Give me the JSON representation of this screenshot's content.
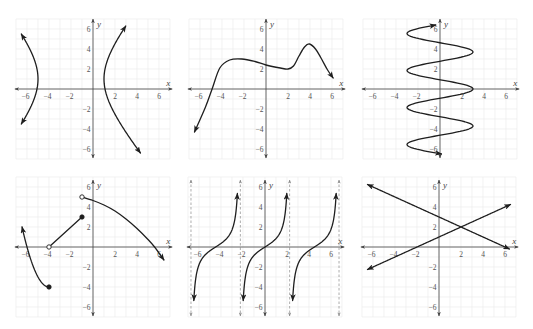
{
  "chart_data": [
    {
      "type": "line",
      "title": "",
      "xlabel": "x",
      "ylabel": "y",
      "xlim": [
        -7.1,
        7.2
      ],
      "ylim": [
        -6.9,
        7.0
      ],
      "grid": true,
      "grid_range": [
        -7,
        7
      ],
      "x_ticks": [
        -6,
        -4,
        -2,
        2,
        4,
        6
      ],
      "x_tick_labels": [
        "−6",
        "−4",
        "−2",
        "2",
        "4",
        "6"
      ],
      "y_ticks": [
        -6,
        -4,
        -2,
        2,
        4,
        6
      ],
      "y_tick_labels": [
        "−6",
        "−4",
        "−2",
        "2",
        "4",
        "6"
      ],
      "asymptotes_x": [],
      "series": [
        {
          "name": "hyperbola left branch",
          "kind": "x_of_y",
          "expr": "-2 - 3*Math.sqrt(1 + ((y-1)/4)**2)",
          "domain": [
            -3.5,
            5.5
          ],
          "start": "arrow",
          "end": "arrow"
        },
        {
          "name": "hyperbola right branch",
          "kind": "x_of_y",
          "expr": "-2 + 3*Math.sqrt(1 + ((y-1)/4)**2)",
          "domain": [
            -6.4,
            6.3
          ],
          "start": "arrow",
          "end": "arrow"
        }
      ],
      "key_points": {
        "vertices": [
          [
            -5,
            1
          ],
          [
            1,
            1
          ]
        ]
      }
    },
    {
      "type": "line",
      "title": "",
      "xlabel": "x",
      "ylabel": "y",
      "xlim": [
        -7.1,
        7.2
      ],
      "ylim": [
        -6.9,
        7.0
      ],
      "grid": true,
      "grid_range": [
        -7,
        7
      ],
      "x_ticks": [
        -6,
        -4,
        -2,
        2,
        4,
        6
      ],
      "x_tick_labels": [
        "−6",
        "−4",
        "−2",
        "2",
        "4",
        "6"
      ],
      "y_ticks": [
        -6,
        -4,
        -2,
        2,
        4,
        6
      ],
      "y_tick_labels": [
        "−6",
        "−4",
        "−2",
        "2",
        "4",
        "6"
      ],
      "asymptotes_x": [],
      "series": [
        {
          "name": "curve",
          "kind": "spline",
          "points": [
            [
              -6.5,
              -4.3
            ],
            [
              -5.5,
              -1.8
            ],
            [
              -4.9,
              0
            ],
            [
              -4.2,
              2.1
            ],
            [
              -3.3,
              2.9
            ],
            [
              -2.2,
              3.0
            ],
            [
              -1,
              2.75
            ],
            [
              0,
              2.4
            ],
            [
              1.3,
              2.1
            ],
            [
              2,
              2.0
            ],
            [
              2.5,
              2.3
            ],
            [
              3,
              3.3
            ],
            [
              3.5,
              4.2
            ],
            [
              3.95,
              4.5
            ],
            [
              4.5,
              4.0
            ],
            [
              5,
              3.1
            ],
            [
              5.6,
              1.9
            ],
            [
              6.1,
              1.1
            ]
          ],
          "start": "arrow",
          "end": "arrow"
        }
      ],
      "key_points": {
        "local_max": [
          [
            -2.2,
            3.0
          ],
          [
            4,
            4.5
          ]
        ],
        "local_min": [
          [
            2,
            2
          ]
        ],
        "x_intercept": [
          -4.9,
          0
        ]
      }
    },
    {
      "type": "line",
      "title": "",
      "xlabel": "x",
      "ylabel": "y",
      "xlim": [
        -7.1,
        7.2
      ],
      "ylim": [
        -6.9,
        7.0
      ],
      "grid": true,
      "grid_range": [
        -7,
        7
      ],
      "x_ticks": [
        -6,
        -4,
        -2,
        2,
        4,
        6
      ],
      "x_tick_labels": [
        "−6",
        "−4",
        "−2",
        "2",
        "4",
        "6"
      ],
      "y_ticks": [
        -6,
        -4,
        -2,
        2,
        4,
        6
      ],
      "y_tick_labels": [
        "−6",
        "−4",
        "−2",
        "2",
        "4",
        "6"
      ],
      "asymptotes_x": [],
      "series": [
        {
          "name": "sinusoid in y",
          "kind": "x_of_y",
          "expr": "3*Math.cos(2*Math.PI*y/3.7)",
          "domain": [
            -6.5,
            6.4
          ],
          "start": "arrow",
          "end": "arrow"
        }
      ],
      "key_points": {
        "rightmost": [
          [
            3,
            0
          ],
          [
            3,
            3.7
          ],
          [
            3,
            -3.7
          ]
        ],
        "leftmost": [
          [
            -3,
            1.85
          ],
          [
            -3,
            -1.85
          ],
          [
            -3,
            5.55
          ],
          [
            -3,
            -5.55
          ]
        ]
      }
    },
    {
      "type": "line",
      "title": "",
      "xlabel": "x",
      "ylabel": "y",
      "xlim": [
        -7.1,
        7.2
      ],
      "ylim": [
        -6.9,
        6.7
      ],
      "grid": true,
      "grid_range": [
        -7,
        7
      ],
      "x_ticks": [
        -6,
        -4,
        -2,
        2,
        4,
        6
      ],
      "x_tick_labels": [
        "−6",
        "−4",
        "−2",
        "2",
        "4",
        "6"
      ],
      "y_ticks": [
        -6,
        -4,
        -2,
        2,
        4,
        6
      ],
      "y_tick_labels": [
        "−6",
        "−4",
        "−2",
        "2",
        "4",
        "6"
      ],
      "asymptotes_x": [],
      "series": [
        {
          "name": "piece 1",
          "kind": "y_of_x",
          "expr": "(x+4)**2 - 4",
          "domain": [
            -6.45,
            -4
          ],
          "start": "arrow",
          "end": "filled"
        },
        {
          "name": "piece 2",
          "kind": "segment",
          "points": [
            [
              -4,
              0
            ],
            [
              -1,
              3
            ]
          ],
          "start": "open",
          "end": "filled"
        },
        {
          "name": "piece 3",
          "kind": "spline",
          "points": [
            [
              -1,
              5
            ],
            [
              0,
              4.65
            ],
            [
              1,
              4.2
            ],
            [
              2,
              3.6
            ],
            [
              3,
              2.8
            ],
            [
              4,
              1.85
            ],
            [
              5,
              0.75
            ],
            [
              5.6,
              0
            ],
            [
              6.45,
              -1.3
            ]
          ],
          "start": "open",
          "end": "arrow"
        }
      ],
      "key_points": {
        "filled": [
          [
            -4,
            -4
          ],
          [
            -1,
            3
          ]
        ],
        "open": [
          [
            -4,
            0
          ],
          [
            -1,
            5
          ]
        ]
      }
    },
    {
      "type": "line",
      "title": "",
      "xlabel": "x",
      "ylabel": "y",
      "xlim": [
        -7.1,
        7.2
      ],
      "ylim": [
        -6.9,
        6.7
      ],
      "grid": true,
      "grid_range": [
        -7,
        7
      ],
      "x_ticks": [
        -6,
        -4,
        -2,
        2,
        4,
        6
      ],
      "x_tick_labels": [
        "−6",
        "−4",
        "−2",
        "2",
        "4",
        "6"
      ],
      "y_ticks": [
        -6,
        -4,
        -2,
        2,
        4,
        6
      ],
      "y_tick_labels": [
        "−6",
        "−4",
        "−2",
        "2",
        "4",
        "6"
      ],
      "asymptotes_x": [
        -6.73,
        -2.24,
        2.24,
        6.73
      ],
      "series": [
        {
          "name": "branch left",
          "kind": "y_of_x",
          "expr": "Math.tan(0.7*(x+4.49))",
          "domain": [
            -6.47,
            -2.51
          ],
          "start": "arrow",
          "end": "arrow"
        },
        {
          "name": "branch center",
          "kind": "y_of_x",
          "expr": "Math.tan(0.7*x)",
          "domain": [
            -1.98,
            1.98
          ],
          "start": "arrow",
          "end": "arrow"
        },
        {
          "name": "branch right",
          "kind": "y_of_x",
          "expr": "Math.tan(0.7*(x-4.49))",
          "domain": [
            2.51,
            6.47
          ],
          "start": "arrow",
          "end": "arrow"
        }
      ],
      "key_points": {
        "x_intercepts": [
          [
            -4.49,
            0
          ],
          [
            0,
            0
          ],
          [
            4.49,
            0
          ]
        ]
      }
    },
    {
      "type": "line",
      "title": "",
      "xlabel": "x",
      "ylabel": "y",
      "xlim": [
        -7.1,
        7.2
      ],
      "ylim": [
        -6.9,
        6.7
      ],
      "grid": true,
      "grid_range": [
        -7,
        7
      ],
      "x_ticks": [
        -6,
        -4,
        -2,
        2,
        4,
        6
      ],
      "x_tick_labels": [
        "−6",
        "−4",
        "−2",
        "2",
        "4",
        "6"
      ],
      "y_ticks": [
        -6,
        -4,
        -2,
        2,
        4,
        6
      ],
      "y_tick_labels": [
        "−6",
        "−4",
        "−2",
        "2",
        "4",
        "6"
      ],
      "asymptotes_x": [],
      "series": [
        {
          "name": "line decreasing",
          "kind": "y_of_x",
          "expr": "3 - x/2",
          "domain": [
            -6.5,
            6.4
          ],
          "start": "arrow",
          "end": "arrow"
        },
        {
          "name": "line increasing",
          "kind": "y_of_x",
          "expr": "x/2 + 1",
          "domain": [
            -6.5,
            6.5
          ],
          "start": "arrow",
          "end": "arrow"
        }
      ],
      "key_points": {
        "intersection": [
          2,
          2
        ],
        "y_intercepts": [
          [
            0,
            3
          ],
          [
            0,
            1
          ]
        ],
        "x_intercepts": [
          [
            6,
            0
          ],
          [
            -2,
            0
          ]
        ]
      }
    }
  ]
}
